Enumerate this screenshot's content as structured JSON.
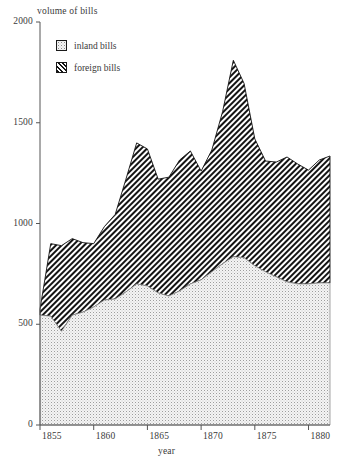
{
  "chart_data": {
    "type": "area",
    "stacked": true,
    "title": "",
    "ylabel": "volume of bills",
    "xlabel": "year",
    "ylim": [
      0,
      2000
    ],
    "xlim": [
      1855,
      1882
    ],
    "yticks": [
      0,
      500,
      1000,
      1500,
      2000
    ],
    "xticks": [
      1855,
      1860,
      1865,
      1870,
      1875,
      1880
    ],
    "grid": false,
    "legend_position": "top-left-inside",
    "x": [
      1855,
      1856,
      1857,
      1858,
      1859,
      1860,
      1861,
      1862,
      1863,
      1864,
      1865,
      1866,
      1867,
      1868,
      1869,
      1870,
      1871,
      1872,
      1873,
      1874,
      1875,
      1876,
      1877,
      1878,
      1879,
      1880,
      1881,
      1882
    ],
    "series": [
      {
        "name": "inland bills",
        "pattern": "dotted",
        "values": [
          545,
          540,
          465,
          545,
          560,
          585,
          620,
          625,
          660,
          700,
          690,
          655,
          640,
          665,
          700,
          720,
          760,
          800,
          835,
          830,
          790,
          760,
          735,
          710,
          700,
          700,
          705,
          705
        ]
      },
      {
        "name": "foreign bills",
        "pattern": "diagonal-hatch",
        "values": [
          30,
          360,
          425,
          380,
          345,
          315,
          365,
          420,
          560,
          700,
          680,
          565,
          590,
          650,
          660,
          540,
          605,
          755,
          975,
          865,
          630,
          550,
          570,
          620,
          595,
          565,
          610,
          630
        ]
      }
    ],
    "totals": [
      575,
      900,
      890,
      925,
      905,
      900,
      985,
      1045,
      1220,
      1400,
      1370,
      1220,
      1230,
      1315,
      1360,
      1260,
      1365,
      1555,
      1810,
      1695,
      1420,
      1310,
      1305,
      1330,
      1295,
      1265,
      1315,
      1335
    ]
  },
  "legend": {
    "items": [
      {
        "label": "inland bills"
      },
      {
        "label": "foreign bills"
      }
    ]
  },
  "axes": {
    "y_title": "volume of bills",
    "x_title": "year",
    "y_tick_labels": [
      "2000",
      "1500",
      "1000",
      "500",
      "0"
    ],
    "x_tick_labels": [
      "1855",
      "1860",
      "1865",
      "1870",
      "1875",
      "1880"
    ]
  },
  "colors": {
    "axis": "#4a4a4a",
    "text": "#3a3a3a",
    "inland_fill": "#f2f2f2",
    "inland_dot": "#9a9a9a",
    "foreign_dark": "#1a1a1a",
    "foreign_light": "#ffffff"
  }
}
